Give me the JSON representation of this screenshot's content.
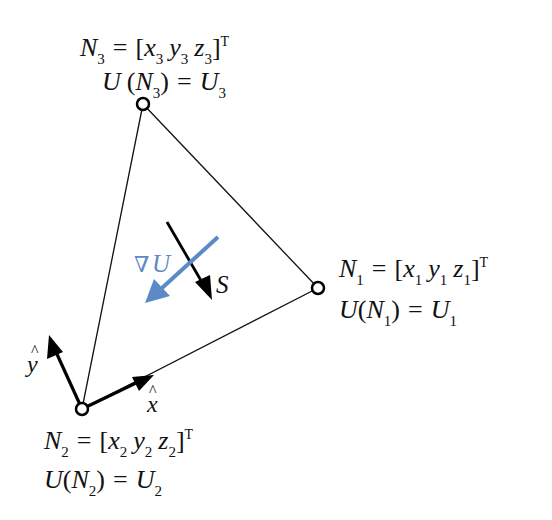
{
  "diagram": {
    "colors": {
      "edge": "#111111",
      "gradient": "#5b8ac6",
      "direction": "#000000",
      "background": "#ffffff"
    },
    "nodes": [
      {
        "id": "N1",
        "x": 318,
        "y": 288,
        "label": {
          "sym": "N",
          "idx": "1",
          "vec": [
            "x",
            "y",
            "z"
          ],
          "transpose": "T",
          "value_line_prefix": "U(N",
          "value_line_mid": ") = U",
          "value_sym": "U"
        }
      },
      {
        "id": "N2",
        "x": 82,
        "y": 409,
        "label": {
          "sym": "N",
          "idx": "2",
          "vec": [
            "x",
            "y",
            "z"
          ],
          "transpose": "T",
          "value_line_prefix": "U(N",
          "value_line_mid": ") = U",
          "value_sym": "U"
        }
      },
      {
        "id": "N3",
        "x": 143,
        "y": 104,
        "label": {
          "sym": "N",
          "idx": "3",
          "vec": [
            "x",
            "y",
            "z"
          ],
          "transpose": "T",
          "value_line_prefix": "U (N",
          "value_line_mid": ") = U",
          "value_sym": "U"
        }
      }
    ],
    "text": {
      "eq": "=",
      "lbracket": "[",
      "rbracket": "]",
      "rparen": ")",
      "T": "T",
      "x": "x",
      "y": "y",
      "z": "z",
      "N": "N",
      "U": "U",
      "U_paren_N_3": "U (N",
      "U_paren_N": "U(N",
      "idx1": "1",
      "idx2": "2",
      "idx3": "3",
      "grad_label_nabla": "∇",
      "grad_label_U": "U",
      "s_label": "S",
      "xhat_label": "x",
      "yhat_label": "y",
      "hat": "^"
    },
    "arrows": {
      "gradient": {
        "label": "∇U",
        "from": [
          218,
          237
        ],
        "to": [
          146,
          302
        ]
      },
      "direction": {
        "label": "S",
        "from": [
          167,
          222
        ],
        "to": [
          211,
          298
        ]
      },
      "x_hat": {
        "label": "x̂",
        "from": [
          82,
          409
        ],
        "to": [
          152,
          376
        ]
      },
      "y_hat": {
        "label": "ŷ",
        "from": [
          82,
          409
        ],
        "to": [
          49,
          337
        ]
      }
    }
  }
}
